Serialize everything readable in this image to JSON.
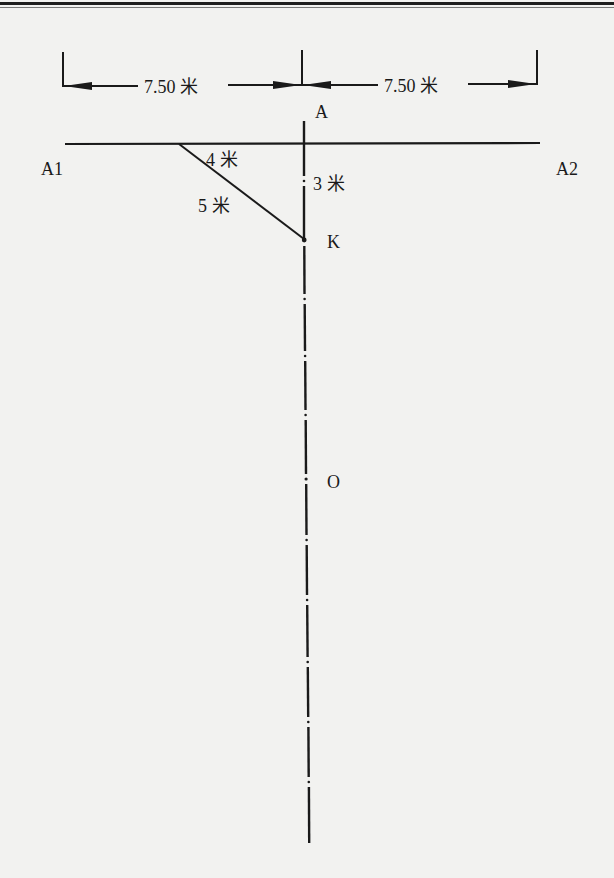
{
  "diagram": {
    "type": "survey-layout",
    "colors": {
      "background": "#f2f2f0",
      "ink": "#1a1a1a",
      "top_rule": "#1e1e1e"
    },
    "dimensions": {
      "left": {
        "value": "7.50",
        "unit": "米"
      },
      "right": {
        "value": "7.50",
        "unit": "米"
      }
    },
    "points": {
      "A": "A",
      "A1": "A1",
      "A2": "A2",
      "K": "K",
      "O": "O"
    },
    "triangle": {
      "horizontal_leg": {
        "value": "4",
        "unit": "米"
      },
      "vertical_leg": {
        "value": "3",
        "unit": "米"
      },
      "hypotenuse": {
        "value": "5",
        "unit": "米"
      }
    },
    "center_line": {
      "style": "dash-dot",
      "description": "Axis line through A, K and O"
    },
    "labels": {
      "dim_left": "7.50 米",
      "dim_right": "7.50 米",
      "leg_4": "4 米",
      "leg_3": "3 米",
      "hyp_5": "5 米"
    }
  }
}
